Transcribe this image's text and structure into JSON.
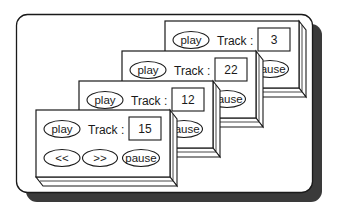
{
  "diagram": {
    "colors": {
      "stroke": "#1a1a1a",
      "shadow": "#3a3a3a",
      "background": "#ffffff"
    },
    "panels": [
      {
        "track_label": "Track :",
        "track_value": "3",
        "play_label": "play",
        "pause_label": "pause",
        "rewind_label": "<<",
        "forward_label": ">>"
      },
      {
        "track_label": "Track :",
        "track_value": "22",
        "play_label": "play",
        "pause_label": "pause",
        "rewind_label": "<<",
        "forward_label": ">>"
      },
      {
        "track_label": "Track :",
        "track_value": "12",
        "play_label": "play",
        "pause_label": "pause",
        "rewind_label": "<<",
        "forward_label": ">>"
      },
      {
        "track_label": "Track :",
        "track_value": "15",
        "play_label": "play",
        "pause_label": "pause",
        "rewind_label": "<<",
        "forward_label": ">>"
      }
    ]
  }
}
